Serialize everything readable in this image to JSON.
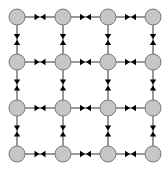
{
  "diagram": {
    "type": "grid-graph",
    "rows": 4,
    "cols": 4,
    "node_fill": "#c6c6c6",
    "node_stroke": "#7a7a7a",
    "edge_color": "#333333",
    "arrow_color": "#000000",
    "edge_style": "two arrowheads meeting at edge midpoint (bidirectional)",
    "nodes": [
      {
        "id": "n-1-1",
        "row": 1,
        "col": 1
      },
      {
        "id": "n-1-2",
        "row": 1,
        "col": 2
      },
      {
        "id": "n-1-3",
        "row": 1,
        "col": 3
      },
      {
        "id": "n-1-4",
        "row": 1,
        "col": 4
      },
      {
        "id": "n-2-1",
        "row": 2,
        "col": 1
      },
      {
        "id": "n-2-2",
        "row": 2,
        "col": 2
      },
      {
        "id": "n-2-3",
        "row": 2,
        "col": 3
      },
      {
        "id": "n-2-4",
        "row": 2,
        "col": 4
      },
      {
        "id": "n-3-1",
        "row": 3,
        "col": 1
      },
      {
        "id": "n-3-2",
        "row": 3,
        "col": 2
      },
      {
        "id": "n-3-3",
        "row": 3,
        "col": 3
      },
      {
        "id": "n-3-4",
        "row": 3,
        "col": 4
      },
      {
        "id": "n-4-1",
        "row": 4,
        "col": 1
      },
      {
        "id": "n-4-2",
        "row": 4,
        "col": 2
      },
      {
        "id": "n-4-3",
        "row": 4,
        "col": 3
      },
      {
        "id": "n-4-4",
        "row": 4,
        "col": 4
      }
    ],
    "edges": [
      {
        "from": "n-1-1",
        "to": "n-1-2",
        "bidirectional": true
      },
      {
        "from": "n-1-2",
        "to": "n-1-3",
        "bidirectional": true
      },
      {
        "from": "n-1-3",
        "to": "n-1-4",
        "bidirectional": true
      },
      {
        "from": "n-2-1",
        "to": "n-2-2",
        "bidirectional": true
      },
      {
        "from": "n-2-2",
        "to": "n-2-3",
        "bidirectional": true
      },
      {
        "from": "n-2-3",
        "to": "n-2-4",
        "bidirectional": true
      },
      {
        "from": "n-3-1",
        "to": "n-3-2",
        "bidirectional": true
      },
      {
        "from": "n-3-2",
        "to": "n-3-3",
        "bidirectional": true
      },
      {
        "from": "n-3-3",
        "to": "n-3-4",
        "bidirectional": true
      },
      {
        "from": "n-4-1",
        "to": "n-4-2",
        "bidirectional": true
      },
      {
        "from": "n-4-2",
        "to": "n-4-3",
        "bidirectional": true
      },
      {
        "from": "n-4-3",
        "to": "n-4-4",
        "bidirectional": true
      },
      {
        "from": "n-1-1",
        "to": "n-2-1",
        "bidirectional": true
      },
      {
        "from": "n-2-1",
        "to": "n-3-1",
        "bidirectional": true
      },
      {
        "from": "n-3-1",
        "to": "n-4-1",
        "bidirectional": true
      },
      {
        "from": "n-1-2",
        "to": "n-2-2",
        "bidirectional": true
      },
      {
        "from": "n-2-2",
        "to": "n-3-2",
        "bidirectional": true
      },
      {
        "from": "n-3-2",
        "to": "n-4-2",
        "bidirectional": true
      },
      {
        "from": "n-1-3",
        "to": "n-2-3",
        "bidirectional": true
      },
      {
        "from": "n-2-3",
        "to": "n-3-3",
        "bidirectional": true
      },
      {
        "from": "n-3-3",
        "to": "n-4-3",
        "bidirectional": true
      },
      {
        "from": "n-1-4",
        "to": "n-2-4",
        "bidirectional": true
      },
      {
        "from": "n-2-4",
        "to": "n-3-4",
        "bidirectional": true
      },
      {
        "from": "n-3-4",
        "to": "n-4-4",
        "bidirectional": true
      }
    ]
  }
}
